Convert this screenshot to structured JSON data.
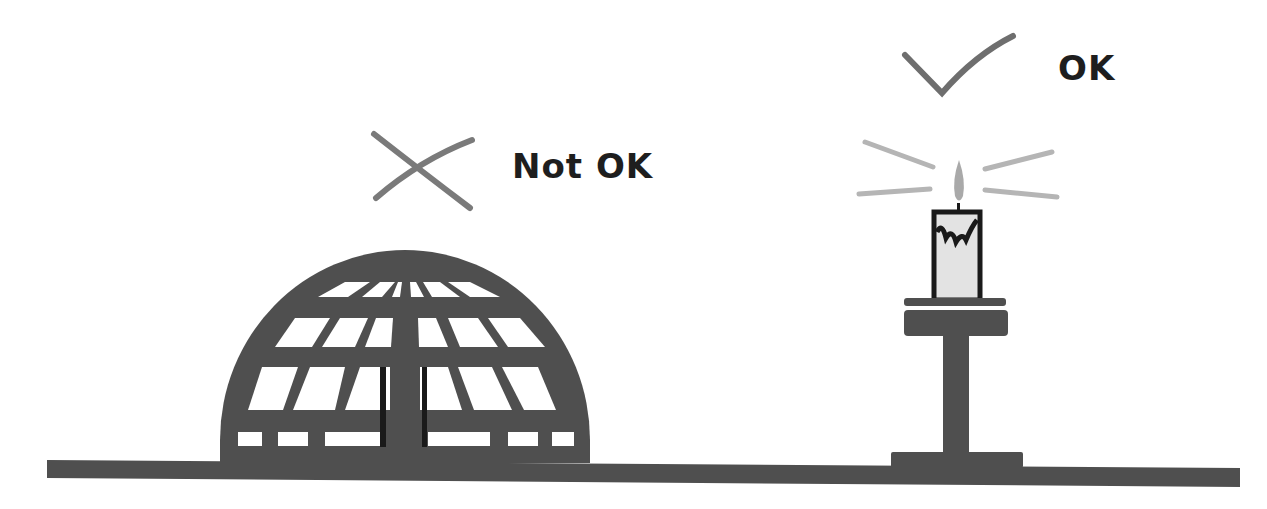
{
  "diagram": {
    "left": {
      "object": "dome-cage",
      "verdict_icon": "cross-icon",
      "label": "Not OK"
    },
    "right": {
      "object": "candle-on-stand",
      "verdict_icon": "check-icon",
      "label": "OK"
    }
  },
  "colors": {
    "structure": "#4f4f4f",
    "mark": "#7a7a7a",
    "rays": "#b5b5b5",
    "flame": "#a9a9a9",
    "candle_body": "#e3e3e3",
    "text": "#1e1e1e"
  }
}
